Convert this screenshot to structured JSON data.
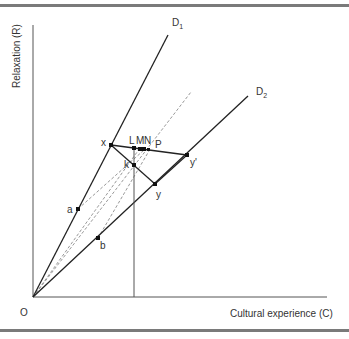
{
  "diagram": {
    "axes": {
      "y_label": "Relaxation (R)",
      "x_label": "Cultural experience (C)",
      "origin_label": "O"
    },
    "rays": [
      {
        "id": "D1",
        "label": "D",
        "subscript": "1"
      },
      {
        "id": "D2",
        "label": "D",
        "subscript": "2"
      }
    ],
    "points": {
      "x": "x",
      "y": "y",
      "y_prime": "y'",
      "a": "a",
      "b": "b",
      "k": "k",
      "L": "L",
      "M": "M",
      "N": "N",
      "P": "P"
    },
    "colors": {
      "line": "#222222",
      "dashed": "#999999",
      "axis": "#555555",
      "rule": "#7a7a7a"
    }
  }
}
